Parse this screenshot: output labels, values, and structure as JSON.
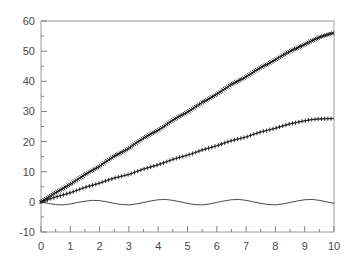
{
  "chart_data": {
    "type": "line",
    "title": "",
    "subtitle": "",
    "xlabel": "",
    "ylabel": "",
    "xlim": [
      0,
      10
    ],
    "ylim": [
      -10,
      60
    ],
    "grid": false,
    "legend": "none",
    "background_color": "#ffffff",
    "axis_color": "#808080",
    "tick_label_color": "#4a4a4a",
    "series_color": "#1a1a1a",
    "x_ticks": [
      "0",
      "1",
      "2",
      "3",
      "4",
      "5",
      "6",
      "7",
      "8",
      "9",
      "10"
    ],
    "x_tick_values": [
      0,
      1,
      2,
      3,
      4,
      5,
      6,
      7,
      8,
      9,
      10
    ],
    "y_ticks": [
      "-10",
      "0",
      "10",
      "20",
      "30",
      "40",
      "50",
      "60"
    ],
    "y_tick_values": [
      -10,
      0,
      10,
      20,
      30,
      40,
      50,
      60
    ],
    "x_minor_step": 0.5,
    "y_minor_step": 5,
    "x": [
      0,
      0.25,
      0.5,
      0.75,
      1,
      1.25,
      1.5,
      1.75,
      2,
      2.25,
      2.5,
      2.75,
      3,
      3.25,
      3.5,
      3.75,
      4,
      4.25,
      4.5,
      4.75,
      5,
      5.25,
      5.5,
      5.75,
      6,
      6.25,
      6.5,
      6.75,
      7,
      7.25,
      7.5,
      7.75,
      8,
      8.25,
      8.5,
      8.75,
      9,
      9.25,
      9.5,
      9.75,
      10
    ],
    "series": [
      {
        "name": "upper",
        "marker": "x-dense",
        "marker_size": 3.4,
        "line": true,
        "values": [
          0,
          1.6,
          3.1,
          4.4,
          5.8,
          7.4,
          9.1,
          10.4,
          11.8,
          13.6,
          15.2,
          16.4,
          17.8,
          19.5,
          21.2,
          22.5,
          23.8,
          25.4,
          27.1,
          28.5,
          29.8,
          31.4,
          33.0,
          34.3,
          35.7,
          37.4,
          39.0,
          40.2,
          41.5,
          43.1,
          44.6,
          45.8,
          47.1,
          48.6,
          50.0,
          51.1,
          52.2,
          53.5,
          54.6,
          55.4,
          56.1
        ]
      },
      {
        "name": "middle",
        "marker": "plus",
        "marker_size": 3.0,
        "line": true,
        "values": [
          0,
          0.8,
          1.6,
          2.3,
          3.0,
          3.9,
          4.8,
          5.5,
          6.2,
          7.1,
          7.9,
          8.5,
          9.1,
          10.0,
          10.9,
          11.6,
          12.3,
          13.2,
          14.1,
          14.8,
          15.5,
          16.3,
          17.2,
          17.9,
          18.6,
          19.5,
          20.3,
          20.9,
          21.5,
          22.4,
          23.2,
          23.8,
          24.4,
          25.2,
          25.9,
          26.4,
          26.9,
          27.3,
          27.5,
          27.6,
          27.6
        ]
      },
      {
        "name": "lower-oscillating",
        "marker": "none",
        "marker_size": 0,
        "line": true,
        "values": [
          -0.1,
          -0.5,
          -0.9,
          -1.0,
          -0.7,
          -0.2,
          0.2,
          0.5,
          0.4,
          0.0,
          -0.5,
          -0.9,
          -1.0,
          -0.7,
          -0.2,
          0.3,
          0.7,
          0.8,
          0.5,
          0.0,
          -0.5,
          -0.9,
          -1.0,
          -0.7,
          -0.2,
          0.3,
          0.7,
          0.8,
          0.5,
          0.0,
          -0.5,
          -0.9,
          -1.0,
          -0.7,
          -0.2,
          0.3,
          0.7,
          0.8,
          0.5,
          0.0,
          -0.5
        ]
      }
    ]
  }
}
